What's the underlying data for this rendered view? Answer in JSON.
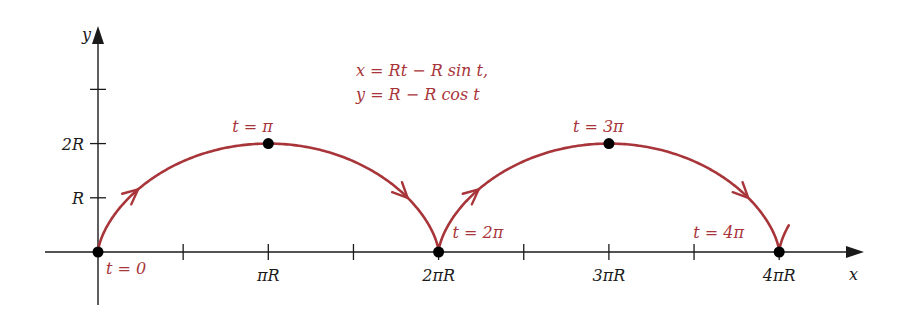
{
  "diagram": {
    "equations": [
      "x = Rt − R sin t,",
      "y = R − R cos t"
    ],
    "axes": {
      "x_label": "x",
      "y_label": "y",
      "x_ticks": [
        {
          "pos": 0.5,
          "label": ""
        },
        {
          "pos": 1,
          "label": "πR"
        },
        {
          "pos": 1.5,
          "label": ""
        },
        {
          "pos": 2,
          "label": "2πR"
        },
        {
          "pos": 2.5,
          "label": ""
        },
        {
          "pos": 3,
          "label": "3πR"
        },
        {
          "pos": 3.5,
          "label": ""
        },
        {
          "pos": 4,
          "label": "4πR"
        }
      ],
      "y_ticks": [
        {
          "pos": 1,
          "label": "R"
        },
        {
          "pos": 2,
          "label": "2R"
        },
        {
          "pos": 3,
          "label": ""
        }
      ]
    },
    "points": [
      {
        "t_over_pi": 0,
        "label": "t = 0"
      },
      {
        "t_over_pi": 1,
        "label": "t = π"
      },
      {
        "t_over_pi": 2,
        "label": "t = 2π"
      },
      {
        "t_over_pi": 3,
        "label": "t = 3π"
      },
      {
        "t_over_pi": 4,
        "label": "t = 4π"
      }
    ],
    "curve": {
      "t_start_over_pi": 0,
      "t_end_over_pi": 4.33,
      "direction_arrows_at_t_over_pi": [
        0.55,
        1.5,
        2.55,
        3.5
      ]
    },
    "colors": {
      "curve": "#a8353a",
      "axis": "#1a1a1a",
      "point": "#000000",
      "annotation": "#a8353a"
    }
  }
}
